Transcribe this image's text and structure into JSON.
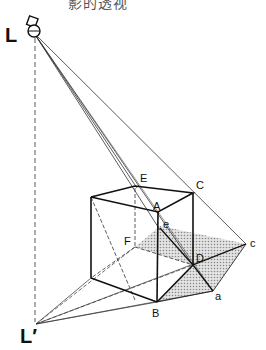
{
  "caption": "影的透视",
  "labels": {
    "light": "L",
    "light_foot": "L′",
    "A": "A",
    "B": "B",
    "C": "C",
    "D": "D",
    "E": "E",
    "F": "F",
    "a": "a",
    "c": "c",
    "e": "e"
  },
  "colors": {
    "line": "#1a1a1a",
    "shadow_fill": "#c8c8c8"
  }
}
